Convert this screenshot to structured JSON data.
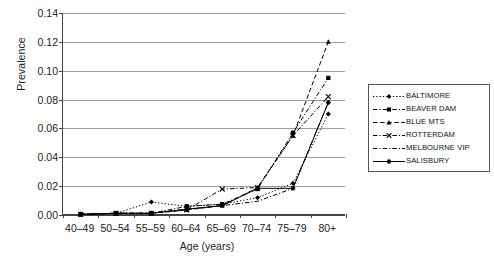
{
  "chart_data": {
    "type": "line",
    "title": "",
    "xlabel": "Age (years)",
    "ylabel": "Prevalence",
    "categories": [
      "40–49",
      "50–54",
      "55–59",
      "60–64",
      "65–69",
      "70–74",
      "75–79",
      "80+"
    ],
    "ylim": [
      0,
      0.14
    ],
    "yticks": [
      "0.00",
      "0.02",
      "0.04",
      "0.06",
      "0.08",
      "0.10",
      "0.12",
      "0.14"
    ],
    "ytick_values": [
      0,
      0.02,
      0.04,
      0.06,
      0.08,
      0.1,
      0.12,
      0.14
    ],
    "grid": true,
    "legend_position": "right",
    "series": [
      {
        "name": "BALTIMORE",
        "marker": "diamond",
        "dash": "dotted",
        "values": [
          0.0005,
          0.0012,
          0.009,
          0.006,
          0.0075,
          0.012,
          0.022,
          0.07
        ]
      },
      {
        "name": "BEAVER DAM",
        "marker": "square",
        "dash": "dash-dot",
        "values": [
          0.0005,
          0.0012,
          0.0012,
          0.006,
          0.0075,
          0.018,
          0.057,
          0.095
        ]
      },
      {
        "name": "BLUE MTS",
        "marker": "triangle",
        "dash": "dashed",
        "values": [
          0.0005,
          0.0012,
          0.0012,
          0.0035,
          0.0065,
          0.019,
          0.055,
          0.12
        ]
      },
      {
        "name": "ROTTERDAM",
        "marker": "x",
        "dash": "dash-dot",
        "values": [
          0.0005,
          0.0012,
          0.0012,
          0.0035,
          0.018,
          0.019,
          0.055,
          0.082
        ]
      },
      {
        "name": "MELBOURNE VIP",
        "marker": "none",
        "dash": "dash-dot",
        "values": [
          0.0005,
          0.0012,
          0.0012,
          0.004,
          0.0065,
          0.0095,
          0.0185,
          0.078
        ]
      },
      {
        "name": "SALISBURY",
        "marker": "star",
        "dash": "solid",
        "values": [
          0.0005,
          0.0012,
          0.0012,
          0.004,
          0.0065,
          0.0185,
          0.0185,
          0.078
        ]
      }
    ]
  }
}
